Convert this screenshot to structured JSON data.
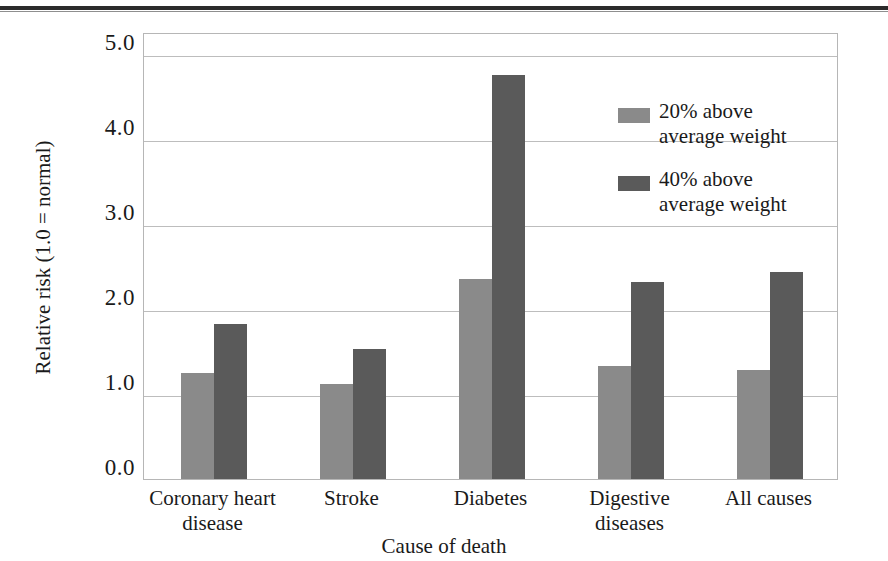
{
  "chart_data": {
    "type": "bar",
    "title": "",
    "xlabel": "Cause of death",
    "ylabel": "Relative risk (1.0 = normal)",
    "categories": [
      "Coronary heart\ndisease",
      "Stroke",
      "Diabetes",
      "Digestive\ndiseases",
      "All causes"
    ],
    "series": [
      {
        "name": "20% above\naverage weight",
        "color": "#8a8a8a",
        "values": [
          1.25,
          1.12,
          2.35,
          1.33,
          1.28
        ]
      },
      {
        "name": "40% above\naverage weight",
        "color": "#5a5a5a",
        "values": [
          1.82,
          1.53,
          4.75,
          2.32,
          2.43
        ]
      }
    ],
    "ylim": [
      0.0,
      5.0
    ],
    "yticks": [
      "0.0",
      "1.0",
      "2.0",
      "3.0",
      "4.0",
      "5.0"
    ],
    "grid": true,
    "legend_position": "inside-upper-right"
  },
  "legend": {
    "items": [
      {
        "label": "20% above\naverage weight"
      },
      {
        "label": "40% above\naverage weight"
      }
    ]
  }
}
